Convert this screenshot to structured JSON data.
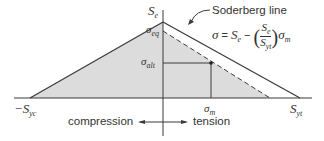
{
  "diagram": {
    "title": "Soderberg line",
    "equation": {
      "lhs": "σ",
      "equals": "=",
      "s_e": "S",
      "s_e_sub": "e",
      "minus": "−",
      "frac_num": "S",
      "frac_num_sub": "e",
      "frac_den": "S",
      "frac_den_sub": "yt",
      "sigma_m": "σ",
      "sigma_m_sub": "m"
    },
    "labels": {
      "se": {
        "main": "S",
        "sub": "e"
      },
      "sigma_eq": {
        "main": "σ",
        "sub": "eq"
      },
      "sigma_alt": {
        "main": "σ",
        "sub": "alt"
      },
      "sigma_m": {
        "main": "σ",
        "sub": "m"
      },
      "neg_syc": {
        "main": "−S",
        "sub": "yc"
      },
      "syt": {
        "main": "S",
        "sub": "yt"
      }
    },
    "direction": {
      "compression": "compression",
      "tension": "tension"
    },
    "colors": {
      "line": "#3a3a3a",
      "fill": "#dcdcdc",
      "text": "#333333"
    }
  }
}
